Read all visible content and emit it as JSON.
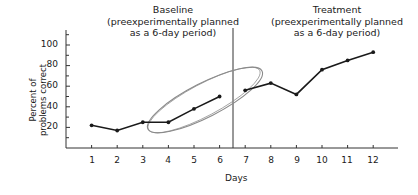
{
  "chart_data": {
    "type": "line",
    "title": "",
    "xlabel": "Days",
    "ylabel": "Percent of problems correct",
    "ylabel_lines": [
      "Percent of",
      "problems correct"
    ],
    "x": [
      1,
      2,
      3,
      4,
      5,
      6,
      7,
      8,
      9,
      10,
      11,
      12
    ],
    "xticks": [
      "1",
      "2",
      "3",
      "4",
      "5",
      "6",
      "7",
      "8",
      "9",
      "10",
      "11",
      "12"
    ],
    "yticks": [
      "20",
      "40",
      "60",
      "80",
      "100"
    ],
    "ylim": [
      0,
      110
    ],
    "xlim": [
      0,
      13
    ],
    "grid": false,
    "phase_divider_x": 6.5,
    "phases": [
      {
        "name": "Baseline",
        "subtitle_lines": [
          "(preexperimentally planned",
          "as a 6-day period)"
        ],
        "days": [
          1,
          2,
          3,
          4,
          5,
          6
        ]
      },
      {
        "name": "Treatment",
        "subtitle_lines": [
          "(preexperimentally planned",
          "as a 6-day period)"
        ],
        "days": [
          7,
          8,
          9,
          10,
          11,
          12
        ]
      }
    ],
    "series": [
      {
        "name": "Baseline",
        "x": [
          1,
          2,
          3,
          4,
          5,
          6
        ],
        "values": [
          22,
          17,
          25,
          25,
          38,
          50
        ]
      },
      {
        "name": "Treatment",
        "x": [
          7,
          8,
          9,
          10,
          11,
          12
        ],
        "values": [
          56,
          63,
          52,
          76,
          85,
          93
        ]
      }
    ],
    "annotations": [
      {
        "type": "ellipse",
        "description": "gray tilted ellipse enclosing baseline days 3-6 and day 7, highlighting rising trend",
        "color": "#8a8a8a"
      }
    ]
  },
  "labels": {
    "baseline_title": "Baseline",
    "baseline_sub1": "(preexperimentally planned",
    "baseline_sub2": "as a 6-day period)",
    "treatment_title": "Treatment",
    "treatment_sub1": "(preexperimentally planned",
    "treatment_sub2": "as a 6-day period)",
    "ylabel_line1": "Percent of",
    "ylabel_line2": "problems correct",
    "xlabel": "Days",
    "y100": "100",
    "y80": "80",
    "y60": "60",
    "y40": "40",
    "y20": "20",
    "x1": "1",
    "x2": "2",
    "x3": "3",
    "x4": "4",
    "x5": "5",
    "x6": "6",
    "x7": "7",
    "x8": "8",
    "x9": "9",
    "x10": "10",
    "x11": "11",
    "x12": "12"
  },
  "colors": {
    "line": "#1a1a1a",
    "axis": "#333333",
    "ellipse": "#8a8a8a"
  }
}
